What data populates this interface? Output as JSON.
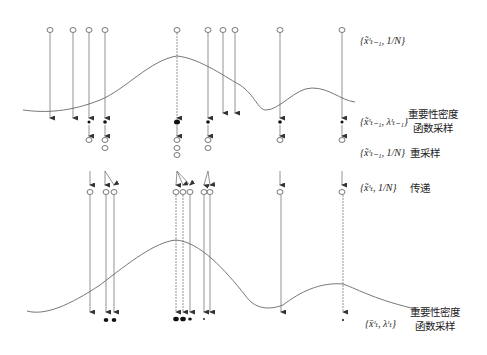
{
  "diagram": {
    "title": "",
    "rows": [
      {
        "id": "prior",
        "math": "{x̃ᶦₜ₋₁, 1/N}",
        "label": ""
      },
      {
        "id": "weighting1",
        "math": "{x̃ᶦₜ₋₁, λᶦₜ₋₁}",
        "label_line1": "重要性密度",
        "label_line2": "函数采样"
      },
      {
        "id": "resample",
        "math": "{x̃ᶦₜ₋₁, 1/N}",
        "label": "重采样"
      },
      {
        "id": "propagate",
        "math": "{x̃ᶦₜ, 1/N}",
        "label": "传递"
      },
      {
        "id": "weighting2",
        "math": "{x̄ᶦₜ, λᶦₜ}",
        "label_line1": "重要性密度",
        "label_line2": "函数采样"
      }
    ],
    "particle_count_top": 11,
    "line_color": "#555555",
    "curve_color": "#666666"
  }
}
